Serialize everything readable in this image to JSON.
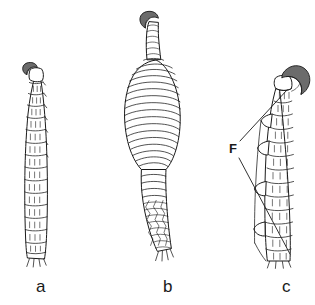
{
  "figure": {
    "background_color": "#ffffff",
    "ink_color": "#1a1a1a",
    "claw_fill_color": "#6b6b6b",
    "width": 315,
    "height": 305
  },
  "captions": {
    "a": "a",
    "b": "b",
    "c": "c"
  },
  "callouts": [
    {
      "label": "F",
      "x": 229,
      "y": 142,
      "leader_upper": "237,140 to 287,90",
      "leader_lower": "236,157 to 289,254"
    }
  ],
  "specimens": [
    {
      "id": "a",
      "caption": "a",
      "description": "slender tapering segmented appendage, slight S-curve, small dark apical claw tilted left",
      "segment_count": 15,
      "claw": {
        "present": true,
        "size": "small",
        "fill": "#6b6b6b",
        "orientation": "left"
      },
      "surface": "rectangular segments with paired vertical setal ticks",
      "bbox": {
        "x": 16,
        "y": 62,
        "width": 48,
        "height": 200
      }
    },
    {
      "id": "b",
      "caption": "b",
      "description": "appendage with greatly swollen ovoid basal bulb bearing dense wavy annulations, narrow reticulate distal shaft, small hooked dark claw on short striated stalk at apex",
      "annulation_count": 21,
      "claw": {
        "present": true,
        "size": "small",
        "fill": "#6b6b6b",
        "orientation": "hooked-left"
      },
      "surface": "wavy transverse annulations on bulb; rhomboid reticulate scales on shaft",
      "bbox": {
        "x": 123,
        "y": 14,
        "width": 76,
        "height": 248
      }
    },
    {
      "id": "c",
      "caption": "c",
      "description": "robust segmented appendage with large dark curved apical claw and a lateral row of flange-like projections marked F",
      "segment_count": 13,
      "claw": {
        "present": true,
        "size": "large",
        "fill": "#6b6b6b",
        "orientation": "right-curving"
      },
      "surface": "broad rectangular segments with vertical setal ticks and lateral flanges",
      "bbox": {
        "x": 252,
        "y": 66,
        "width": 58,
        "height": 196
      }
    }
  ]
}
